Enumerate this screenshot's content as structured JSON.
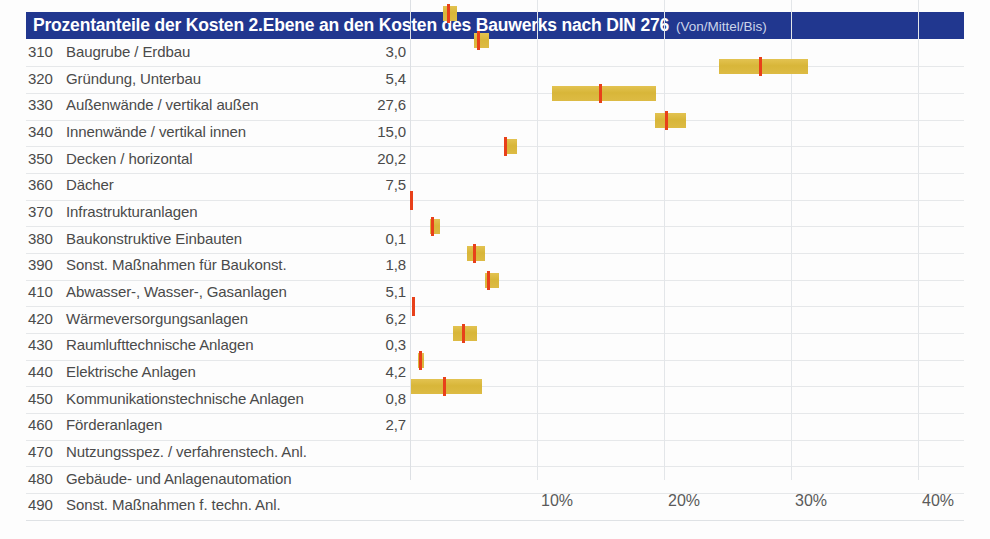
{
  "header": {
    "title": "Prozentanteile der Kosten 2.Ebene an den Kosten des Bauwerks nach DIN 276",
    "subtitle": "(Von/Mittel/Bis)",
    "bar_color": "#21378f",
    "text_color": "#ffffff"
  },
  "colors": {
    "range_bar": "#d9b83c",
    "mid_marker": "#e8401a",
    "gridline": "#e3e6e9",
    "row_separator": "#e6e8ea",
    "text": "#4a4a4a"
  },
  "chart_data": {
    "type": "bar",
    "title": "Prozentanteile der Kosten 2.Ebene an den Kosten des Bauwerks nach DIN 276",
    "subtitle": "(Von/Mittel/Bis)",
    "xlabel": "",
    "ylabel": "",
    "xlim": [
      0,
      43.6
    ],
    "xticks": [
      10,
      20,
      30,
      40
    ],
    "xticklabels": [
      "10%",
      "20%",
      "30%",
      "40%"
    ],
    "grid": true,
    "legend": null,
    "orientation": "horizontal",
    "value_format": "German decimal comma",
    "series": [
      {
        "name": "Von",
        "role": "range-start"
      },
      {
        "name": "Mittel",
        "role": "marker"
      },
      {
        "name": "Bis",
        "role": "range-end"
      }
    ],
    "categories": [
      {
        "code": "310",
        "label": "Baugrube / Erdbau",
        "value": "3,0",
        "mittel": 3.0,
        "von": 2.6,
        "bis": 3.7
      },
      {
        "code": "320",
        "label": "Gründung, Unterbau",
        "value": "5,4",
        "mittel": 5.4,
        "von": 5.0,
        "bis": 6.2
      },
      {
        "code": "330",
        "label": "Außenwände / vertikal außen",
        "value": "27,6",
        "mittel": 27.6,
        "von": 24.3,
        "bis": 31.3
      },
      {
        "code": "340",
        "label": "Innenwände / vertikal innen",
        "value": "15,0",
        "mittel": 15.0,
        "von": 11.2,
        "bis": 19.4
      },
      {
        "code": "350",
        "label": "Decken / horizontal",
        "value": "20,2",
        "mittel": 20.2,
        "von": 19.3,
        "bis": 21.7
      },
      {
        "code": "360",
        "label": "Dächer",
        "value": "7,5",
        "mittel": 7.5,
        "von": 7.4,
        "bis": 8.4
      },
      {
        "code": "370",
        "label": "Infrastrukturanlagen",
        "value": "",
        "mittel": null,
        "von": null,
        "bis": null
      },
      {
        "code": "380",
        "label": "Baukonstruktive Einbauten",
        "value": "0,1",
        "mittel": 0.1,
        "von": 0.1,
        "bis": 0.1
      },
      {
        "code": "390",
        "label": "Sonst. Maßnahmen für Baukonst.",
        "value": "1,8",
        "mittel": 1.8,
        "von": 1.6,
        "bis": 2.4
      },
      {
        "code": "410",
        "label": "Abwasser-, Wasser-, Gasanlagen",
        "value": "5,1",
        "mittel": 5.1,
        "von": 4.5,
        "bis": 5.9
      },
      {
        "code": "420",
        "label": "Wärmeversorgungsanlagen",
        "value": "6,2",
        "mittel": 6.2,
        "von": 5.9,
        "bis": 7.0
      },
      {
        "code": "430",
        "label": "Raumlufttechnische Anlagen",
        "value": "0,3",
        "mittel": 0.3,
        "von": 0.3,
        "bis": 0.3
      },
      {
        "code": "440",
        "label": "Elektrische Anlagen",
        "value": "4,2",
        "mittel": 4.2,
        "von": 3.4,
        "bis": 5.3
      },
      {
        "code": "450",
        "label": "Kommunikationstechnische Anlagen",
        "value": "0,8",
        "mittel": 0.8,
        "von": 0.6,
        "bis": 1.1
      },
      {
        "code": "460",
        "label": "Förderanlagen",
        "value": "2,7",
        "mittel": 2.7,
        "von": 0.1,
        "bis": 5.7
      },
      {
        "code": "470",
        "label": "Nutzungsspez. / verfahrenstech. Anl.",
        "value": "",
        "mittel": null,
        "von": null,
        "bis": null
      },
      {
        "code": "480",
        "label": "Gebäude- und Anlagenautomation",
        "value": "",
        "mittel": null,
        "von": null,
        "bis": null
      },
      {
        "code": "490",
        "label": "Sonst. Maßnahmen f. techn. Anl.",
        "value": "",
        "mittel": null,
        "von": null,
        "bis": null
      }
    ]
  }
}
